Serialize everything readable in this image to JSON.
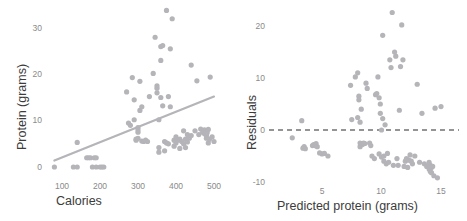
{
  "figure": {
    "point_color": "#b4b4b9",
    "line_color": "#b4b4b9",
    "dash_color": "#2b2b2b",
    "tick_color": "#8a8a8a",
    "title_color": "#3c3c3c",
    "background": "#ffffff"
  },
  "chart_data": [
    {
      "type": "scatter",
      "panel": "left",
      "title": "",
      "xlabel": "Calories",
      "ylabel": "Protein (grams)",
      "xlim": [
        60,
        520
      ],
      "ylim": [
        -1.5,
        35
      ],
      "xticks": [
        100,
        200,
        300,
        400,
        500
      ],
      "yticks": [
        0,
        10,
        20,
        30
      ],
      "grid": false,
      "legend": null,
      "trendline": {
        "type": "linear",
        "x": [
          80,
          500
        ],
        "y": [
          1.4,
          15.2
        ]
      },
      "x": [
        80,
        130,
        140,
        140,
        165,
        170,
        175,
        180,
        185,
        190,
        190,
        200,
        205,
        210,
        270,
        275,
        280,
        285,
        290,
        290,
        295,
        295,
        300,
        300,
        300,
        300,
        305,
        305,
        310,
        310,
        315,
        320,
        325,
        330,
        340,
        345,
        350,
        350,
        350,
        355,
        355,
        355,
        360,
        360,
        360,
        365,
        365,
        370,
        370,
        375,
        375,
        380,
        380,
        385,
        385,
        390,
        395,
        395,
        400,
        400,
        405,
        410,
        410,
        415,
        420,
        420,
        425,
        425,
        430,
        430,
        435,
        440,
        440,
        450,
        455,
        460,
        465,
        470,
        475,
        475,
        478,
        480,
        480,
        480,
        482,
        485,
        485,
        488,
        490,
        495,
        500
      ],
      "y": [
        0,
        0,
        0,
        5.3,
        2.0,
        2.0,
        2.0,
        0,
        2.0,
        0,
        2.0,
        0,
        0,
        0,
        16.2,
        9.5,
        9.0,
        19.3,
        14.5,
        10.2,
        5.8,
        6.0,
        8.5,
        8.0,
        7.5,
        6.2,
        18.5,
        12.2,
        13.0,
        5.6,
        5.5,
        5.8,
        5.5,
        15.2,
        20.2,
        28.0,
        17.5,
        17.0,
        16.0,
        10.2,
        4.2,
        3.2,
        26.0,
        23.0,
        15.0,
        26.2,
        13.2,
        5.5,
        3.5,
        33.8,
        5.2,
        15.2,
        5.0,
        25.5,
        13.0,
        32.0,
        5.8,
        4.5,
        6.5,
        5.2,
        5.8,
        6.0,
        4.0,
        5.5,
        7.8,
        5.0,
        4.2,
        6.0,
        7.0,
        5.4,
        6.2,
        22.0,
        6.8,
        7.8,
        18.6,
        7.0,
        8.2,
        7.5,
        8.0,
        7.2,
        7.6,
        6.8,
        7.0,
        6.2,
        7.4,
        8.1,
        5.2,
        6.0,
        19.4,
        6.5,
        5.5
      ]
    },
    {
      "type": "scatter",
      "panel": "right",
      "title": "",
      "xlabel": "Predicted protein (grams)",
      "ylabel": "Residuals",
      "xlim": [
        2.0,
        15.6
      ],
      "ylim": [
        -11.5,
        24
      ],
      "xticks": [
        5,
        10,
        15
      ],
      "yticks": [
        -10,
        0,
        10,
        20
      ],
      "grid": false,
      "legend": null,
      "reference_line": {
        "type": "horizontal-dashed",
        "y": 0
      },
      "x": [
        2.5,
        3.3,
        3.4,
        3.5,
        3.6,
        4.2,
        4.3,
        4.4,
        4.5,
        4.6,
        4.8,
        5.0,
        5.2,
        5.5,
        7.4,
        7.5,
        7.8,
        8.0,
        8.0,
        8.1,
        8.1,
        8.2,
        8.2,
        8.2,
        8.3,
        8.3,
        8.4,
        8.5,
        8.6,
        8.7,
        8.8,
        9.0,
        9.1,
        9.2,
        9.4,
        9.5,
        9.6,
        9.7,
        9.8,
        9.8,
        9.9,
        9.9,
        10.0,
        10.0,
        10.1,
        10.1,
        10.2,
        10.2,
        10.3,
        10.4,
        10.5,
        10.6,
        10.7,
        10.8,
        10.9,
        11.0,
        11.1,
        11.2,
        11.3,
        11.4,
        11.5,
        11.6,
        11.7,
        11.8,
        11.9,
        12.0,
        12.1,
        12.2,
        12.3,
        12.4,
        12.5,
        12.6,
        12.8,
        13.0,
        13.2,
        13.4,
        13.6,
        13.8,
        14.0,
        14.0,
        14.1,
        14.1,
        14.2,
        14.2,
        14.3,
        14.4,
        14.5,
        14.7,
        15.0
      ],
      "y": [
        -1.5,
        1.8,
        -3.5,
        -3.2,
        -3.6,
        -3.0,
        -2.8,
        -3.0,
        -2.6,
        -3.2,
        -4.4,
        -4.6,
        -4.5,
        -5.0,
        8.6,
        2.0,
        10.2,
        11.0,
        2.4,
        6.5,
        5.8,
        1.5,
        -2.5,
        -3.2,
        4.0,
        -2.6,
        -2.8,
        -2.5,
        -2.6,
        9.0,
        8.0,
        -2.5,
        -3.0,
        -5.0,
        -5.5,
        6.8,
        7.0,
        10.2,
        6.2,
        -4.6,
        5.0,
        3.2,
        0.0,
        -5.2,
        18.2,
        2.2,
        -5.0,
        -6.0,
        1.0,
        -6.5,
        -4.5,
        -6.2,
        13.5,
        12.0,
        22.6,
        -6.8,
        15.0,
        14.2,
        -5.5,
        -6.8,
        3.8,
        12.2,
        20.2,
        13.5,
        -7.0,
        -6.0,
        -5.5,
        -7.2,
        -5.8,
        -4.8,
        -6.0,
        -6.5,
        -5.0,
        8.8,
        -6.2,
        3.2,
        -6.5,
        -7.0,
        -6.2,
        -7.5,
        -8.0,
        -6.8,
        -7.2,
        -8.2,
        -7.0,
        -8.8,
        4.2,
        -9.2,
        4.5
      ]
    }
  ],
  "left_panel": {
    "xlabel": "Calories",
    "ylabel": "Protein (grams)",
    "xticks": [
      "100",
      "200",
      "300",
      "400",
      "500"
    ],
    "yticks": [
      "30",
      "20",
      "10",
      "0"
    ]
  },
  "right_panel": {
    "xlabel": "Predicted protein (grams)",
    "ylabel": "Residuals",
    "xticks": [
      "5",
      "10",
      "15"
    ],
    "yticks": [
      "20",
      "10",
      "0",
      "-10"
    ]
  }
}
